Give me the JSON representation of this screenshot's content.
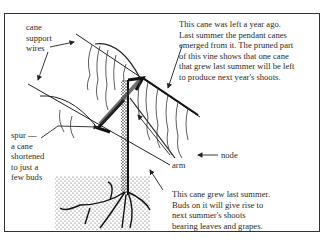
{
  "diagram": {
    "type": "grapevine cane pruning illustration",
    "labels": {
      "support_wires": [
        "cane",
        "support",
        "wires"
      ],
      "top_note": [
        "This cane  was left a year ago.",
        "Last summer the pendant canes",
        "emerged from it. The pruned part",
        "of this vine shows that one cane",
        "that grew last summer will be left",
        "to produce next year's shoots."
      ],
      "spur": [
        "spur —",
        "a cane",
        "shortened",
        "to just a",
        "few buds"
      ],
      "arm": "arm",
      "node": "node",
      "bottom_note": [
        "This cane grew last summer.",
        "Buds on it will give rise to",
        "next summer's shoots",
        "bearing leaves and grapes."
      ]
    },
    "colors": {
      "ink": "#222222",
      "background": "#ffffff",
      "soil_dots": "#555555"
    }
  }
}
